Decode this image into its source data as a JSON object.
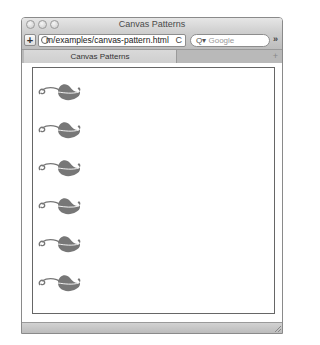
{
  "window": {
    "title": "Canvas Patterns",
    "traffic_lights": [
      "close",
      "minimize",
      "zoom"
    ]
  },
  "toolbar": {
    "add_label": "+",
    "url": "m/examples/canvas-pattern.html",
    "reload_icon": "C",
    "search_placeholder": "Google",
    "search_icon": "Q▾",
    "overflow_label": "»"
  },
  "tabs": [
    {
      "label": "Canvas Patterns",
      "active": true
    }
  ],
  "tabbar": {
    "new_tab_label": "+"
  },
  "canvas": {
    "pattern": "leaf-icon",
    "pattern_color": "#777777",
    "repeat": "repeat-y",
    "leaf_offsets_y": [
      12,
      50,
      88,
      126,
      164,
      203,
      241
    ]
  }
}
